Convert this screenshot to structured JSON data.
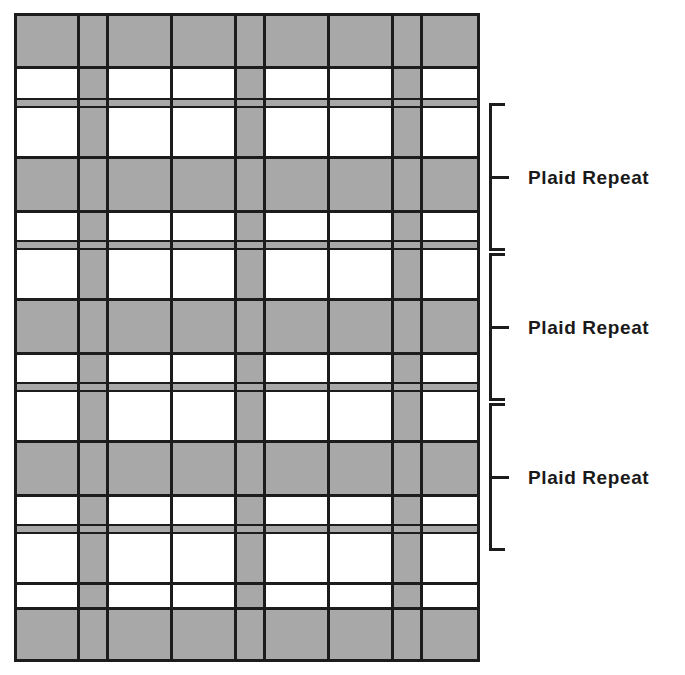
{
  "figure": {
    "colors": {
      "gray": "#a8a8a8",
      "white": "#ffffff",
      "line": "#1c1c1c"
    }
  },
  "annotations": {
    "repeat_label": "Plaid Repeat",
    "brackets": [
      {
        "label": "Plaid Repeat",
        "top": 103,
        "height": 148
      },
      {
        "label": "Plaid Repeat",
        "top": 253,
        "height": 148
      },
      {
        "label": "Plaid Repeat",
        "top": 403,
        "height": 148
      }
    ]
  },
  "chart_data": {
    "type": "heatmap",
    "title": "Plaid Repeat",
    "xlabel": "",
    "ylabel": "",
    "columns": [
      {
        "index": 0,
        "x": 0,
        "width": 64,
        "fill": "white"
      },
      {
        "index": 1,
        "x": 64,
        "width": 29,
        "fill": "gray"
      },
      {
        "index": 2,
        "x": 93,
        "width": 64,
        "fill": "white"
      },
      {
        "index": 3,
        "x": 157,
        "width": 64,
        "fill": "white"
      },
      {
        "index": 4,
        "x": 221,
        "width": 29,
        "fill": "gray"
      },
      {
        "index": 5,
        "x": 250,
        "width": 64,
        "fill": "white"
      },
      {
        "index": 6,
        "x": 314,
        "width": 64,
        "fill": "white"
      },
      {
        "index": 7,
        "x": 378,
        "width": 29,
        "fill": "gray"
      },
      {
        "index": 8,
        "x": 407,
        "width": 59,
        "fill": "white"
      }
    ],
    "rows": [
      {
        "index": 0,
        "y": 0,
        "height": 54,
        "fill": "gray"
      },
      {
        "index": 1,
        "y": 54,
        "height": 32,
        "fill": "white"
      },
      {
        "index": 2,
        "y": 86,
        "height": 8,
        "fill": "gray"
      },
      {
        "index": 3,
        "y": 94,
        "height": 50,
        "fill": "white"
      },
      {
        "index": 4,
        "y": 144,
        "height": 54,
        "fill": "gray"
      },
      {
        "index": 5,
        "y": 198,
        "height": 30,
        "fill": "white"
      },
      {
        "index": 6,
        "y": 228,
        "height": 8,
        "fill": "gray"
      },
      {
        "index": 7,
        "y": 236,
        "height": 50,
        "fill": "white"
      },
      {
        "index": 8,
        "y": 286,
        "height": 54,
        "fill": "gray"
      },
      {
        "index": 9,
        "y": 340,
        "height": 30,
        "fill": "white"
      },
      {
        "index": 10,
        "y": 370,
        "height": 8,
        "fill": "gray"
      },
      {
        "index": 11,
        "y": 378,
        "height": 50,
        "fill": "white"
      },
      {
        "index": 12,
        "y": 428,
        "height": 54,
        "fill": "gray"
      },
      {
        "index": 13,
        "y": 482,
        "height": 30,
        "fill": "white"
      },
      {
        "index": 14,
        "y": 512,
        "height": 8,
        "fill": "gray"
      },
      {
        "index": 15,
        "y": 520,
        "height": 50,
        "fill": "white"
      },
      {
        "index": 16,
        "y": 570,
        "height": 25,
        "fill": "white"
      },
      {
        "index": 17,
        "y": 595,
        "height": 54,
        "fill": "gray"
      }
    ],
    "repeat_count": 3,
    "repeat_height_px": 148,
    "legend": [
      "Plaid Repeat"
    ]
  }
}
